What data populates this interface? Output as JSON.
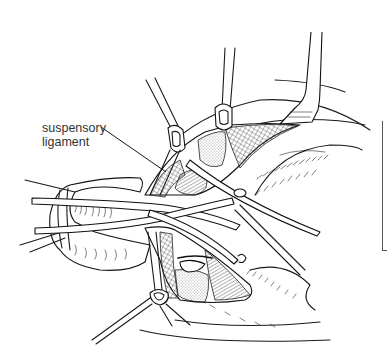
{
  "figure": {
    "type": "surgical line illustration",
    "labels": [
      {
        "id": "suspensory-ligament",
        "line1": "suspensory",
        "line2": "ligament"
      }
    ],
    "colors": {
      "ink": "#1a1a1a",
      "label_text": "#333333",
      "background": "#ffffff"
    }
  }
}
